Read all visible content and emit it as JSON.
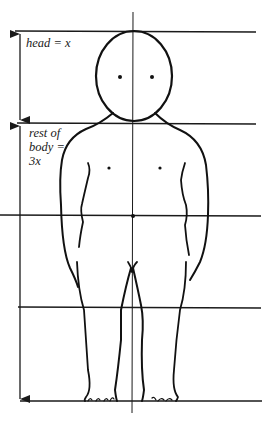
{
  "diagram": {
    "type": "body-proportion-figure",
    "labels": {
      "head": "head = x",
      "body_line1": "rest of",
      "body_line2": "body =",
      "body_line3": "3x"
    },
    "proportion": {
      "head_units": 1,
      "rest_of_body_units": 3,
      "total_units": 4
    },
    "guide_lines": {
      "horizontal_count": 5,
      "vertical_center": true
    },
    "colors": {
      "ink": "#1a1a1a",
      "background": "#ffffff"
    }
  }
}
